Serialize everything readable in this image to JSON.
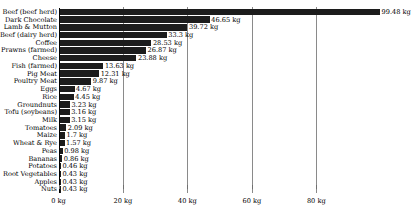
{
  "chart_data": {
    "type": "bar",
    "orientation": "horizontal",
    "title": "",
    "xlabel": "",
    "ylabel": "",
    "xlim": [
      0,
      105
    ],
    "grid": true,
    "legend": null,
    "unit": "kg",
    "bar_color": "#1c1c1c",
    "xticks": [
      {
        "value": 0,
        "label": "0 kg"
      },
      {
        "value": 20,
        "label": "20 kg"
      },
      {
        "value": 40,
        "label": "40 kg"
      },
      {
        "value": 60,
        "label": "60 kg"
      },
      {
        "value": 80,
        "label": "80 kg"
      }
    ],
    "categories": [
      "Beef (beef herd)",
      "Dark Chocolate",
      "Lamb & Mutton",
      "Beef (dairy herd)",
      "Coffee",
      "Prawns (farmed)",
      "Cheese",
      "Fish (farmed)",
      "Pig Meat",
      "Poultry Meat",
      "Eggs",
      "Rice",
      "Groundnuts",
      "Tofu (soybeans)",
      "Milk",
      "Tomatoes",
      "Maize",
      "Wheat & Rye",
      "Peas",
      "Bananas",
      "Potatoes",
      "Root Vegetables",
      "Apples",
      "Nuts"
    ],
    "values": [
      99.48,
      46.65,
      39.72,
      33.3,
      28.53,
      26.87,
      23.88,
      13.63,
      12.31,
      9.87,
      4.67,
      4.45,
      3.23,
      3.16,
      3.15,
      2.09,
      1.7,
      1.57,
      0.98,
      0.86,
      0.46,
      0.43,
      0.43,
      0.43
    ],
    "value_labels": [
      "99.48 kg",
      "46.65 kg",
      "39.72 kg",
      "33.3 kg",
      "28.53 kg",
      "26.87 kg",
      "23.88 kg",
      "13.63 kg",
      "12.31 kg",
      "9.87 kg",
      "4.67 kg",
      "4.45 kg",
      "3.23 kg",
      "3.16 kg",
      "3.15 kg",
      "2.09 kg",
      "1.7 kg",
      "1.57 kg",
      "0.98 kg",
      "0.86 kg",
      "0.46 kg",
      "0.43 kg",
      "0.43 kg",
      "0.43 kg"
    ]
  }
}
